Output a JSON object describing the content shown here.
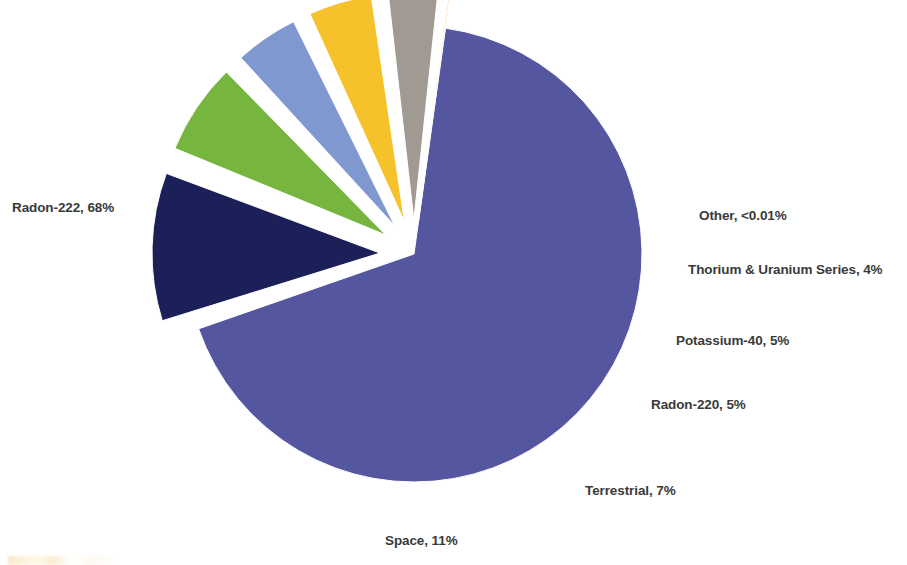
{
  "chart_data": {
    "type": "pie",
    "title": "",
    "subtitle": "",
    "xlabel": "",
    "ylabel": "",
    "legend_position": "none",
    "labels_position": "outside-callout",
    "grid": false,
    "categories": [
      "Radon-222",
      "Space",
      "Terrestrial",
      "Radon-220",
      "Potassium-40",
      "Thorium & Uranium Series",
      "Other"
    ],
    "values": [
      68,
      11,
      7,
      5,
      5,
      4,
      0.005
    ],
    "value_labels": [
      "68%",
      "11%",
      "7%",
      "5%",
      "5%",
      "4%",
      "<0.01%"
    ],
    "colors": [
      "#5456a0",
      "#1b2158",
      "#76b63f",
      "#8098d0",
      "#f5c22b",
      "#a09a92",
      "#f47b20"
    ],
    "exploded": [
      false,
      true,
      true,
      true,
      true,
      true,
      true
    ],
    "slices": [
      {
        "name": "radon-222",
        "label": "Radon-222, 68%",
        "category": "Radon-222",
        "value": 68,
        "value_label": "68%",
        "color": "#5456a0",
        "exploded": false
      },
      {
        "name": "space",
        "label": "Space, 11%",
        "category": "Space",
        "value": 11,
        "value_label": "11%",
        "color": "#1b2158",
        "exploded": true
      },
      {
        "name": "terrestrial",
        "label": "Terrestrial, 7%",
        "category": "Terrestrial",
        "value": 7,
        "value_label": "7%",
        "color": "#76b63f",
        "exploded": true
      },
      {
        "name": "radon-220",
        "label": "Radon-220, 5%",
        "category": "Radon-220",
        "value": 5,
        "value_label": "5%",
        "color": "#8098d0",
        "exploded": true
      },
      {
        "name": "potassium-40",
        "label": "Potassium-40, 5%",
        "category": "Potassium-40",
        "value": 5,
        "value_label": "5%",
        "color": "#f5c22b",
        "exploded": true
      },
      {
        "name": "thorium-uranium-series",
        "label": "Thorium & Uranium Series, 4%",
        "category": "Thorium & Uranium Series",
        "value": 4,
        "value_label": "4%",
        "color": "#a09a92",
        "exploded": true
      },
      {
        "name": "other",
        "label": "Other, <0.01%",
        "category": "Other",
        "value": 0.005,
        "value_label": "<0.01%",
        "color": "#f47b20",
        "exploded": true
      }
    ]
  },
  "labels": {
    "radon_222": "Radon-222, 68%",
    "other": "Other, <0.01%",
    "thorium_uranium": "Thorium & Uranium Series, 4%",
    "potassium_40": "Potassium-40, 5%",
    "radon_220": "Radon-220, 5%",
    "terrestrial": "Terrestrial, 7%",
    "space": "Space, 11%"
  },
  "style": {
    "background": "#ffffff",
    "label_color": "#3a3a3a",
    "slice_gap_color": "#ffffff"
  }
}
